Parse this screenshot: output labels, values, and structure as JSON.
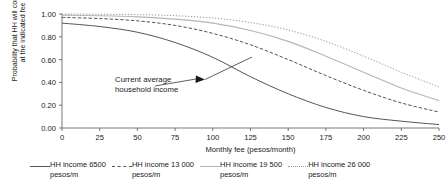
{
  "chart_data": {
    "type": "line",
    "title": "",
    "xlabel": "Monthly fee (pesos/month)",
    "ylabel_line1": "Probability that HH will connect",
    "ylabel_line2": "at the indicated fee",
    "xlim": [
      0,
      250
    ],
    "ylim": [
      0.0,
      1.0
    ],
    "xticks": [
      0,
      25,
      50,
      75,
      100,
      125,
      150,
      175,
      200,
      225,
      250
    ],
    "xtick_labels": [
      "0",
      "25",
      "50",
      "75",
      "100",
      "125",
      "150",
      "175",
      "200",
      "225",
      "250"
    ],
    "yticks": [
      0.0,
      0.2,
      0.4,
      0.6,
      0.8,
      1.0
    ],
    "ytick_labels": [
      "0.00",
      "0.20",
      "0.40",
      "0.60",
      "0.80",
      "1.00"
    ],
    "grid": false,
    "legend_position": "below",
    "x": [
      0,
      25,
      50,
      75,
      100,
      125,
      150,
      175,
      200,
      225,
      250
    ],
    "series": [
      {
        "name": "HH income 6500 pesos/m",
        "style": "solid",
        "color": "#555555",
        "width": 1.0,
        "values": [
          0.92,
          0.89,
          0.84,
          0.75,
          0.62,
          0.45,
          0.3,
          0.18,
          0.1,
          0.06,
          0.03
        ]
      },
      {
        "name": "HH income 13 000 pesos/m",
        "style": "dashed",
        "color": "#555555",
        "width": 1.0,
        "values": [
          0.97,
          0.96,
          0.94,
          0.9,
          0.83,
          0.73,
          0.6,
          0.46,
          0.33,
          0.22,
          0.14
        ]
      },
      {
        "name": "HH income 19 500 pesos/m",
        "style": "solid",
        "color": "#b5b5b5",
        "width": 1.1,
        "values": [
          0.99,
          0.985,
          0.975,
          0.955,
          0.92,
          0.855,
          0.76,
          0.63,
          0.49,
          0.35,
          0.24
        ]
      },
      {
        "name": "HH income 26 000 pesos/m",
        "style": "dotted",
        "color": "#9a9a9a",
        "width": 1.0,
        "values": [
          1.0,
          0.998,
          0.995,
          0.985,
          0.965,
          0.925,
          0.86,
          0.76,
          0.63,
          0.49,
          0.36
        ]
      }
    ],
    "annotations": [
      {
        "name": "current-average-household-income",
        "line1": "Current average",
        "line2": "household income",
        "arrow": "points right to the solid 6500 pesos/m curve"
      }
    ]
  },
  "axes": {
    "ylabel_line1": "Probability that HH will connect",
    "ylabel_line2": "at the indicated fee",
    "xlabel": "Monthly fee (pesos/month)"
  },
  "annotation": {
    "line1": "Current average",
    "line2": "household income"
  },
  "legend": {
    "entries": [
      {
        "label": "HH income 6500\npesos/m",
        "style": "solid",
        "color": "#555555"
      },
      {
        "label": "HH income 13 000\npesos/m",
        "style": "dashed",
        "color": "#555555"
      },
      {
        "label": "HH income 19 500\npesos/m",
        "style": "solid",
        "color": "#b5b5b5"
      },
      {
        "label": "HH income 26 000\npesos/m",
        "style": "dotted",
        "color": "#9a9a9a"
      }
    ]
  }
}
